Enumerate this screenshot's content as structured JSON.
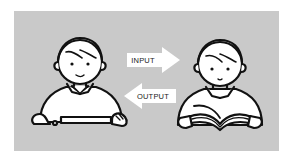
{
  "diagram": {
    "background_color": "#ffffff",
    "panel_color": "#c9c9c9",
    "line_color": "#111111",
    "fill_color": "#ffffff",
    "left_figure": {
      "role": "person-typing-on-keyboard"
    },
    "right_figure": {
      "role": "person-reading-book"
    },
    "arrows": [
      {
        "label": "INPUT",
        "direction": "right"
      },
      {
        "label": "OUTPUT",
        "direction": "left"
      }
    ]
  }
}
